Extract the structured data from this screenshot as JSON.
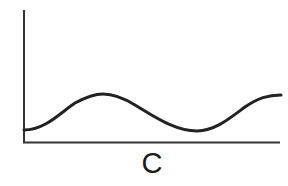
{
  "figure": {
    "x_axis_label": "C",
    "curve_description": "smooth wave: starts low, rises to a peak, falls to a trough, rises again",
    "colors": {
      "line": "#222222",
      "axis": "#333333",
      "background": "#ffffff"
    }
  }
}
